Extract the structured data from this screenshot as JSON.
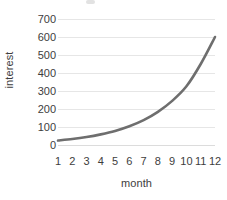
{
  "chart_data": {
    "type": "line",
    "title": "",
    "subtitle": "",
    "xlabel": "month",
    "ylabel": "interest",
    "categories": [
      1,
      2,
      3,
      4,
      5,
      6,
      7,
      8,
      9,
      10,
      11,
      12
    ],
    "x": [
      1,
      2,
      3,
      4,
      5,
      6,
      7,
      8,
      9,
      10,
      11,
      12
    ],
    "values": [
      25,
      33,
      44,
      59,
      78,
      104,
      138,
      184,
      245,
      326,
      450,
      600
    ],
    "series": [
      {
        "name": "interest",
        "color": "#6e6e6e",
        "values": [
          25,
          33,
          44,
          59,
          78,
          104,
          138,
          184,
          245,
          326,
          450,
          600
        ]
      }
    ],
    "xlim": [
      1,
      12
    ],
    "ylim": [
      0,
      700
    ],
    "y_ticks": [
      0,
      100,
      200,
      300,
      400,
      500,
      600,
      700
    ],
    "x_ticks": [
      1,
      2,
      3,
      4,
      5,
      6,
      7,
      8,
      9,
      10,
      11,
      12
    ],
    "y_tick_labels": [
      "0",
      "100",
      "200",
      "300",
      "400",
      "500",
      "600",
      "700"
    ],
    "x_tick_labels": [
      "1",
      "2",
      "3",
      "4",
      "5",
      "6",
      "7",
      "8",
      "9",
      "10",
      "11",
      "12"
    ],
    "grid": true,
    "grid_axis": "y",
    "grid_color": "#e6e6e6",
    "legend": false,
    "legend_position": "none",
    "line_width": 2.6,
    "markers": false,
    "annotations": [],
    "background_color": "#ffffff",
    "text_color": "#3d3d3d"
  }
}
